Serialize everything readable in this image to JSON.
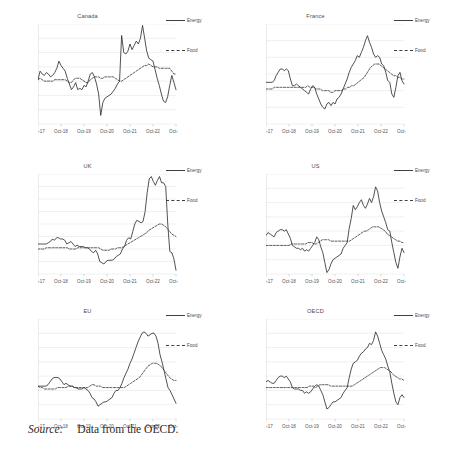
{
  "figure": {
    "source_label": "Source:",
    "source_text": "Data from the OECD.",
    "legend": {
      "energy": "Energy",
      "food": "Food"
    },
    "line_color": "#333333"
  },
  "chart_data": [
    {
      "type": "line",
      "title": "Canada",
      "xlabel": "",
      "ylabel": "",
      "grid": true,
      "legend_position": "right",
      "xlim": [
        0,
        72
      ],
      "ylim": [
        -30,
        40
      ],
      "yticks": [
        40,
        30,
        20,
        10,
        0,
        -10,
        -20,
        -30
      ],
      "xticks": [
        "Oct-17",
        "Oct-18",
        "Oct-19",
        "Oct-20",
        "Oct-21",
        "Oct-22",
        "Oct-23"
      ],
      "series": [
        {
          "name": "Energy",
          "style": "solid",
          "values": [
            1,
            7,
            5,
            4,
            6,
            5,
            3,
            4,
            6,
            9,
            14,
            11,
            9,
            7,
            2,
            -2,
            -6,
            -4,
            -1,
            -6,
            -5,
            -6,
            -3,
            -4,
            0,
            5,
            6,
            3,
            -2,
            -9,
            -24,
            -15,
            -12,
            -11,
            -10,
            -9,
            -7,
            -5,
            -2,
            0,
            32,
            20,
            19,
            21,
            26,
            22,
            25,
            28,
            26,
            30,
            39,
            30,
            21,
            16,
            15,
            14,
            8,
            2,
            -3,
            -9,
            -14,
            -15,
            -11,
            -3,
            4,
            -1,
            -6
          ]
        },
        {
          "name": "Food",
          "style": "dashed",
          "values": [
            1,
            2,
            1,
            0,
            0,
            0,
            0,
            0,
            1,
            1,
            1,
            1,
            1,
            1,
            0,
            -1,
            -1,
            1,
            2,
            2,
            2,
            1,
            0,
            -1,
            -1,
            1,
            2,
            3,
            3,
            3,
            2,
            2,
            3,
            3,
            3,
            3,
            3,
            2,
            1,
            0,
            0,
            1,
            2,
            3,
            4,
            5,
            6,
            7,
            8,
            9,
            10,
            11,
            11,
            12,
            11,
            10,
            10,
            10,
            9,
            9,
            9,
            9,
            9,
            9,
            7,
            5,
            5
          ]
        }
      ]
    },
    {
      "type": "line",
      "title": "France",
      "xlabel": "",
      "ylabel": "",
      "grid": true,
      "legend_position": "right",
      "xlim": [
        0,
        72
      ],
      "ylim": [
        -20,
        40
      ],
      "yticks": [
        40,
        30,
        20,
        10,
        0,
        -10,
        -20
      ],
      "xticks": [
        "Oct-17",
        "Oct-18",
        "Oct-19",
        "Oct-20",
        "Oct-21",
        "Oct-22",
        "Oct-23"
      ],
      "series": [
        {
          "name": "Energy",
          "style": "solid",
          "values": [
            5,
            5,
            5,
            5,
            6,
            9,
            11,
            13,
            13,
            12,
            13,
            12,
            7,
            3,
            3,
            4,
            3,
            2,
            1,
            0,
            -1,
            -2,
            1,
            3,
            2,
            -2,
            -5,
            -8,
            -10,
            -11,
            -8,
            -7,
            -9,
            -7,
            -8,
            -5,
            -4,
            -2,
            1,
            4,
            7,
            11,
            14,
            16,
            18,
            21,
            20,
            23,
            26,
            30,
            33,
            29,
            26,
            22,
            20,
            21,
            20,
            16,
            15,
            11,
            6,
            5,
            -2,
            -4,
            2,
            9,
            11,
            6,
            4
          ]
        },
        {
          "name": "Food",
          "style": "dashed",
          "values": [
            1,
            1,
            1,
            1,
            2,
            2,
            2,
            2,
            2,
            2,
            2,
            2,
            2,
            2,
            2,
            2,
            2,
            2,
            2,
            2,
            3,
            2,
            2,
            2,
            1,
            1,
            1,
            0,
            0,
            0,
            0,
            -1,
            -1,
            0,
            0,
            0,
            0,
            1,
            1,
            2,
            2,
            3,
            3,
            4,
            5,
            6,
            7,
            8,
            10,
            12,
            14,
            15,
            16,
            16,
            16,
            15,
            14,
            13,
            12,
            11,
            10,
            9,
            9,
            8,
            8,
            7,
            7
          ]
        }
      ]
    },
    {
      "type": "line",
      "title": "UK",
      "xlabel": "",
      "ylabel": "",
      "grid": true,
      "legend_position": "right",
      "xlim": [
        0,
        72
      ],
      "ylim": [
        -20,
        60
      ],
      "yticks": [
        60,
        50,
        40,
        30,
        20,
        10,
        0,
        -10,
        -20
      ],
      "xticks": [
        "Oct-17",
        "Oct-18",
        "Oct-19",
        "Oct-20",
        "Oct-21",
        "Oct-22",
        "Oct-23"
      ],
      "series": [
        {
          "name": "Energy",
          "style": "solid",
          "values": [
            4,
            4,
            4,
            4,
            4,
            5,
            6,
            8,
            7,
            9,
            9,
            8,
            8,
            7,
            4,
            5,
            6,
            4,
            2,
            3,
            2,
            2,
            2,
            1,
            1,
            0,
            -2,
            -3,
            -1,
            -4,
            -10,
            -11,
            -12,
            -10,
            -9,
            -9,
            -9,
            -8,
            -6,
            -5,
            -4,
            0,
            2,
            7,
            9,
            8,
            14,
            20,
            23,
            22,
            21,
            22,
            30,
            45,
            56,
            58,
            54,
            51,
            55,
            58,
            53,
            53,
            50,
            20,
            -2,
            -3,
            -8,
            -17
          ]
        },
        {
          "name": "Food",
          "style": "dashed",
          "values": [
            0,
            0,
            0,
            0,
            1,
            1,
            1,
            1,
            1,
            1,
            1,
            1,
            1,
            1,
            1,
            0,
            0,
            0,
            0,
            1,
            1,
            1,
            1,
            1,
            1,
            1,
            1,
            1,
            1,
            1,
            0,
            -1,
            -1,
            -1,
            -1,
            0,
            0,
            0,
            1,
            1,
            1,
            2,
            3,
            4,
            5,
            6,
            7,
            8,
            9,
            10,
            11,
            12,
            13,
            15,
            16,
            17,
            18,
            19,
            20,
            20,
            19,
            18,
            16,
            14,
            12,
            11,
            10
          ]
        }
      ]
    },
    {
      "type": "line",
      "title": "US",
      "xlabel": "",
      "ylabel": "",
      "grid": true,
      "legend_position": "right",
      "xlim": [
        0,
        72
      ],
      "ylim": [
        -20,
        50
      ],
      "yticks": [
        50,
        40,
        30,
        20,
        10,
        0,
        -10,
        -20
      ],
      "xticks": [
        "Oct-17",
        "Oct-18",
        "Oct-19",
        "Oct-20",
        "Oct-21",
        "Oct-22",
        "Oct-23"
      ],
      "series": [
        {
          "name": "Energy",
          "style": "solid",
          "values": [
            7,
            9,
            8,
            7,
            6,
            9,
            10,
            11,
            11,
            10,
            11,
            8,
            5,
            0,
            -1,
            -2,
            -2,
            -3,
            -2,
            -4,
            -3,
            -4,
            -2,
            0,
            2,
            6,
            4,
            -1,
            -5,
            -12,
            -19,
            -17,
            -13,
            -10,
            -9,
            -8,
            -7,
            -6,
            -2,
            0,
            2,
            12,
            19,
            28,
            25,
            27,
            30,
            32,
            28,
            26,
            29,
            33,
            30,
            34,
            41,
            38,
            30,
            24,
            20,
            16,
            11,
            10,
            2,
            -5,
            -12,
            -16,
            -8,
            -2,
            -5
          ]
        },
        {
          "name": "Food",
          "style": "dashed",
          "values": [
            0,
            0,
            0,
            0,
            0,
            0,
            0,
            0,
            0,
            0,
            0,
            0,
            1,
            1,
            1,
            1,
            1,
            1,
            1,
            1,
            2,
            2,
            2,
            1,
            1,
            2,
            3,
            4,
            4,
            4,
            4,
            3,
            3,
            3,
            3,
            3,
            3,
            3,
            3,
            3,
            3,
            4,
            5,
            6,
            7,
            8,
            9,
            10,
            10,
            11,
            12,
            13,
            13,
            13,
            13,
            12,
            11,
            10,
            8,
            7,
            6,
            5,
            4,
            3,
            3,
            2,
            2
          ]
        }
      ]
    },
    {
      "type": "line",
      "title": "EU",
      "xlabel": "",
      "ylabel": "",
      "grid": true,
      "legend_position": "right",
      "xlim": [
        0,
        72
      ],
      "ylim": [
        -20,
        50
      ],
      "yticks": [
        50,
        40,
        30,
        20,
        10,
        0,
        -10,
        -20
      ],
      "xticks": [
        "Oct-17",
        "Oct-18",
        "Oct-19",
        "Oct-20",
        "Oct-21",
        "Oct-22",
        "Oct-23"
      ],
      "series": [
        {
          "name": "Energy",
          "style": "solid",
          "values": [
            3,
            3,
            3,
            3,
            3,
            4,
            6,
            8,
            9,
            9,
            9,
            8,
            6,
            4,
            5,
            4,
            3,
            3,
            2,
            2,
            1,
            1,
            1,
            2,
            1,
            0,
            -2,
            -5,
            -6,
            -8,
            -11,
            -10,
            -9,
            -8,
            -8,
            -7,
            -6,
            -5,
            -2,
            0,
            0,
            2,
            5,
            9,
            12,
            15,
            19,
            22,
            26,
            30,
            34,
            37,
            40,
            41,
            40,
            38,
            39,
            40,
            40,
            38,
            33,
            25,
            20,
            14,
            8,
            2,
            0,
            -3,
            -6,
            -9
          ]
        },
        {
          "name": "Food",
          "style": "dashed",
          "values": [
            3,
            2,
            2,
            1,
            1,
            1,
            1,
            1,
            1,
            2,
            2,
            2,
            2,
            2,
            3,
            3,
            3,
            2,
            2,
            2,
            2,
            2,
            2,
            2,
            3,
            4,
            4,
            3,
            3,
            3,
            2,
            2,
            2,
            2,
            2,
            2,
            2,
            2,
            2,
            2,
            2,
            3,
            4,
            5,
            6,
            7,
            8,
            9,
            11,
            13,
            15,
            17,
            18,
            19,
            19,
            19,
            18,
            17,
            15,
            13,
            11,
            9,
            8,
            7,
            7
          ]
        }
      ]
    },
    {
      "type": "line",
      "title": "OECD",
      "xlabel": "",
      "ylabel": "",
      "grid": true,
      "legend_position": "right",
      "xlim": [
        0,
        72
      ],
      "ylim": [
        -20,
        50
      ],
      "yticks": [
        50,
        40,
        30,
        20,
        10,
        0,
        -10,
        -20
      ],
      "xticks": [
        "Oct-17",
        "Oct-18",
        "Oct-19",
        "Oct-20",
        "Oct-21",
        "Oct-22",
        "Oct-23"
      ],
      "series": [
        {
          "name": "Energy",
          "style": "solid",
          "values": [
            6,
            7,
            6,
            5,
            5,
            7,
            9,
            10,
            10,
            9,
            10,
            8,
            6,
            2,
            1,
            1,
            1,
            0,
            0,
            -2,
            -1,
            -2,
            -1,
            1,
            3,
            4,
            3,
            0,
            -3,
            -8,
            -13,
            -12,
            -10,
            -8,
            -8,
            -7,
            -6,
            -5,
            -2,
            0,
            2,
            9,
            15,
            19,
            20,
            21,
            24,
            26,
            27,
            29,
            30,
            33,
            32,
            35,
            41,
            38,
            33,
            28,
            25,
            22,
            17,
            13,
            5,
            -2,
            -8,
            -10,
            -5,
            -3,
            -5
          ]
        },
        {
          "name": "Food",
          "style": "dashed",
          "values": [
            2,
            2,
            2,
            2,
            2,
            2,
            2,
            2,
            2,
            2,
            2,
            2,
            2,
            2,
            2,
            2,
            2,
            2,
            2,
            2,
            3,
            3,
            3,
            2,
            3,
            4,
            4,
            4,
            4,
            4,
            3,
            3,
            3,
            3,
            3,
            3,
            3,
            3,
            3,
            3,
            3,
            4,
            5,
            6,
            7,
            8,
            9,
            10,
            11,
            12,
            13,
            14,
            15,
            16,
            16,
            16,
            15,
            14,
            13,
            11,
            10,
            9,
            8,
            8,
            7
          ]
        }
      ]
    }
  ]
}
